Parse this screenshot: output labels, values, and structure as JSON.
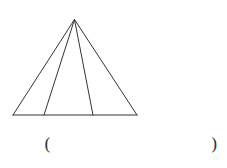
{
  "diagram": {
    "type": "geometry-figure",
    "stroke_color": "#333333",
    "apex": {
      "x": 74.5,
      "y": 19.5
    },
    "base_left": {
      "x": 13,
      "y": 115
    },
    "base_right": {
      "x": 137,
      "y": 115
    },
    "inner_base_points": [
      {
        "x": 44,
        "y": 115
      },
      {
        "x": 93,
        "y": 115
      }
    ]
  },
  "answer": {
    "open_paren": "(",
    "close_paren": ")",
    "value": ""
  }
}
